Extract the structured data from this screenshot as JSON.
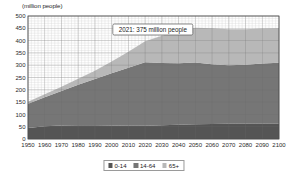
{
  "chart_data": {
    "type": "area",
    "stacked": true,
    "title": "",
    "xlabel": "",
    "ylabel": "(million people)",
    "unit_label": "(million people)",
    "ylim": [
      0,
      500
    ],
    "ytick_step": 50,
    "yticks": [
      "0",
      "50",
      "100",
      "150",
      "200",
      "250",
      "300",
      "350",
      "400",
      "450",
      "500"
    ],
    "xlim": [
      1950,
      2100
    ],
    "x": [
      1950,
      1960,
      1970,
      1980,
      1990,
      2000,
      2010,
      2020,
      2030,
      2040,
      2050,
      2060,
      2070,
      2080,
      2090,
      2100
    ],
    "xticks": [
      "1950",
      "1960",
      "1970",
      "1980",
      "1990",
      "2000",
      "2010",
      "2020",
      "2030",
      "2040",
      "2050",
      "2060",
      "2070",
      "2080",
      "2090",
      "2100"
    ],
    "grid": true,
    "minor_grid": true,
    "legend_position": "bottom",
    "series": [
      {
        "name": "0-14",
        "color": "#555555",
        "values": [
          45,
          52,
          55,
          56,
          56,
          55,
          54,
          54,
          56,
          58,
          60,
          61,
          62,
          62,
          62,
          62
        ]
      },
      {
        "name": "14-64",
        "color": "#767676",
        "values": [
          98,
          118,
          140,
          165,
          188,
          212,
          236,
          258,
          253,
          250,
          251,
          243,
          238,
          240,
          245,
          248
        ]
      },
      {
        "name": "65+",
        "color": "#b8b8b8",
        "values": [
          8,
          12,
          17,
          24,
          33,
          48,
          65,
          85,
          111,
          132,
          141,
          146,
          146,
          144,
          142,
          140
        ]
      }
    ],
    "totals": [
      151,
      182,
      212,
      245,
      277,
      315,
      355,
      397,
      420,
      440,
      452,
      450,
      446,
      446,
      449,
      450
    ],
    "annotations": [
      {
        "label": "2021: 375 million people",
        "year": 2021,
        "value": 375
      }
    ]
  },
  "legend": {
    "items": [
      {
        "label": "0-14",
        "color": "#555555"
      },
      {
        "label": "14-64",
        "color": "#767676"
      },
      {
        "label": "65+",
        "color": "#b8b8b8"
      }
    ]
  }
}
